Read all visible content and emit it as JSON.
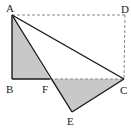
{
  "diagram": {
    "type": "geometry",
    "points": {
      "A": {
        "label": "A",
        "x": 12,
        "y": 15
      },
      "B": {
        "label": "B",
        "x": 12,
        "y": 79
      },
      "C": {
        "label": "C",
        "x": 124,
        "y": 79
      },
      "D": {
        "label": "D",
        "x": 125,
        "y": 15
      },
      "E": {
        "label": "E",
        "x": 72,
        "y": 112
      },
      "F": {
        "label": "F",
        "x": 50,
        "y": 79
      }
    },
    "shaded_regions": [
      "triangle ABF",
      "triangle FEC"
    ],
    "dashed_segments": [
      "AD",
      "DC",
      "FC"
    ],
    "solid_segments": [
      "AB",
      "BF",
      "AC",
      "AE",
      "EC"
    ],
    "colors": {
      "line": "#1a1a1a",
      "shade": "#c8c8c8",
      "dashed": "#888888"
    }
  }
}
